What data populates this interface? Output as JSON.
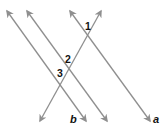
{
  "diagram": {
    "type": "parallel-lines-cut-by-transversal",
    "line_color": "#8f8f8f",
    "lines": [
      {
        "id": "line-b",
        "label": "b",
        "x1": 7,
        "y1": 11,
        "x2": 86,
        "y2": 121
      },
      {
        "id": "line-middle",
        "label": "",
        "x1": 27,
        "y1": 11,
        "x2": 107,
        "y2": 121
      },
      {
        "id": "line-a",
        "label": "a",
        "x1": 70,
        "y1": 11,
        "x2": 150,
        "y2": 121
      },
      {
        "id": "transversal",
        "label": "",
        "x1": 101,
        "y1": 11,
        "x2": 40,
        "y2": 121
      }
    ],
    "labels": {
      "line_b": "b",
      "line_a": "a",
      "angle_1": "1",
      "angle_2": "2",
      "angle_3": "3"
    }
  }
}
